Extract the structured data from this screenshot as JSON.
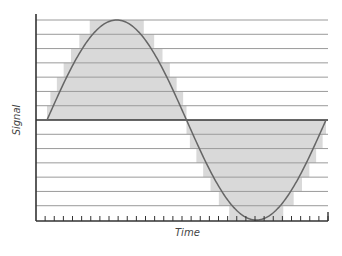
{
  "chart_data": {
    "type": "line",
    "title": "",
    "xlabel": "Time",
    "ylabel": "Signal",
    "levels_above_zero": 7,
    "levels_below_zero": 7,
    "x_ticks_count": 33,
    "series": [
      {
        "name": "Analog signal",
        "style": "smooth curve",
        "color": "#666666",
        "x": [
          0,
          0.125,
          0.25,
          0.375,
          0.5,
          0.625,
          0.75,
          0.875,
          1.0
        ],
        "values": [
          0,
          0.707,
          1,
          0.707,
          0,
          -0.707,
          -1,
          -0.707,
          0
        ]
      },
      {
        "name": "Quantized signal",
        "style": "stepped fill",
        "color": "#d8d8d8"
      }
    ],
    "grid": {
      "horizontal": true,
      "vertical": false
    },
    "ylim": [
      -1,
      1
    ]
  },
  "colors": {
    "fill": "#d9d9d9",
    "grid": "#9a9a9a",
    "axis": "#333333",
    "curve": "#666666"
  },
  "labels": {
    "x": "Time",
    "y": "Signal"
  }
}
